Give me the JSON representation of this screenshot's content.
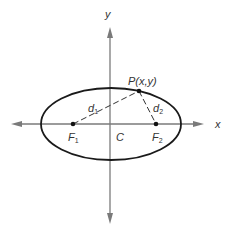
{
  "diagram": {
    "type": "ellipse-foci",
    "axes": {
      "x_label": "x",
      "y_label": "y",
      "color": "#7a7a7a"
    },
    "ellipse": {
      "center_label": "C",
      "stroke": "#1a1a1a"
    },
    "foci": {
      "f1": {
        "letter": "F",
        "sub": "1"
      },
      "f2": {
        "letter": "F",
        "sub": "2"
      }
    },
    "point": {
      "label": "P(x,y)"
    },
    "distances": {
      "d1": {
        "letter": "d",
        "sub": "1"
      },
      "d2": {
        "letter": "d",
        "sub": "2"
      }
    }
  }
}
